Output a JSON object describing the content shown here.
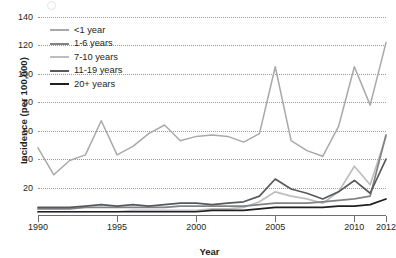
{
  "chart_data": {
    "type": "line",
    "title": "",
    "xlabel": "Year",
    "ylabel": "Incidence (per 100,000)",
    "xlim": [
      1990,
      2012
    ],
    "ylim": [
      0,
      140
    ],
    "yticks": [
      20,
      40,
      60,
      80,
      100,
      120,
      140
    ],
    "xticks": [
      1990,
      1995,
      2000,
      2005,
      2010,
      2012
    ],
    "xtick_labels": [
      "1990",
      "1995",
      "2000",
      "2005",
      "2010",
      "2012"
    ],
    "ytick_labels": [
      "20",
      "40",
      "60",
      "80",
      "100",
      "120",
      "140"
    ],
    "grid": "horizontal-dotted",
    "legend_position": "top-left-inside",
    "x": [
      1990,
      1991,
      1992,
      1993,
      1994,
      1995,
      1996,
      1997,
      1998,
      1999,
      2000,
      2001,
      2002,
      2003,
      2004,
      2005,
      2006,
      2007,
      2008,
      2009,
      2010,
      2011,
      2012
    ],
    "series": [
      {
        "name": "<1 year",
        "color": "#a7a9ac",
        "values": [
          48,
          29,
          39,
          43,
          67,
          43,
          49,
          58,
          64,
          53,
          56,
          57,
          56,
          52,
          58,
          105,
          53,
          46,
          42,
          63,
          105,
          78,
          122
        ]
      },
      {
        "name": "1-6 years",
        "color": "#808285",
        "values": [
          5,
          5,
          5,
          6,
          6,
          6,
          6,
          6,
          6,
          7,
          7,
          7,
          7,
          7,
          8,
          9,
          9,
          9,
          10,
          11,
          12,
          14,
          57
        ]
      },
      {
        "name": "7-10 years",
        "color": "#bcbec0",
        "values": [
          3,
          3,
          3,
          3,
          3,
          3,
          4,
          4,
          4,
          4,
          4,
          5,
          5,
          6,
          10,
          17,
          14,
          12,
          9,
          17,
          35,
          22,
          56
        ]
      },
      {
        "name": "11-19 years",
        "color": "#58595b",
        "values": [
          6,
          6,
          6,
          7,
          8,
          7,
          8,
          7,
          8,
          9,
          9,
          8,
          9,
          10,
          14,
          26,
          19,
          16,
          12,
          17,
          25,
          16,
          40
        ]
      },
      {
        "name": "20+ years",
        "color": "#231f20",
        "values": [
          3,
          3,
          3,
          3,
          3,
          3,
          3,
          3,
          3,
          3,
          3,
          4,
          4,
          4,
          5,
          6,
          6,
          6,
          6,
          7,
          7,
          8,
          12
        ]
      }
    ]
  }
}
